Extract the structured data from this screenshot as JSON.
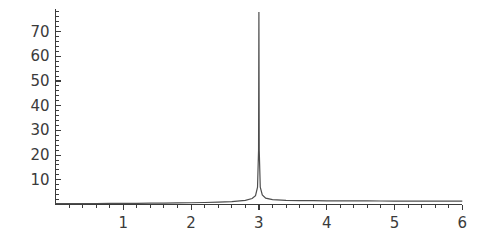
{
  "chart_data": {
    "type": "line",
    "title": "",
    "subtitle": "",
    "xlabel": "",
    "ylabel": "",
    "xlim": [
      0,
      6
    ],
    "ylim": [
      0,
      78
    ],
    "grid": false,
    "legend": null,
    "background_color": "#ffffff",
    "line_color": "#4d4d4d",
    "axis_color": "#3b3b3b",
    "x_ticks": [
      {
        "value": 1,
        "label": "1"
      },
      {
        "value": 2,
        "label": "2"
      },
      {
        "value": 3,
        "label": "3"
      },
      {
        "value": 4,
        "label": "4"
      },
      {
        "value": 5,
        "label": "5"
      },
      {
        "value": 6,
        "label": "6"
      }
    ],
    "y_ticks": [
      {
        "value": 10,
        "label": "10"
      },
      {
        "value": 20,
        "label": "20"
      },
      {
        "value": 30,
        "label": "30"
      },
      {
        "value": 40,
        "label": "40"
      },
      {
        "value": 50,
        "label": "50"
      },
      {
        "value": 60,
        "label": "60"
      },
      {
        "value": 70,
        "label": "70"
      }
    ],
    "x_minor_ticks_per_interval": 4,
    "y_minor_ticks_per_interval": 4,
    "annotations": [
      {
        "text": "singular spike at x = 3",
        "x": 3,
        "y": 78
      }
    ],
    "series": [
      {
        "name": "f(x)",
        "x": [
          0.0,
          0.2,
          0.4,
          0.6,
          0.8,
          1.0,
          1.2,
          1.4,
          1.6,
          1.8,
          2.0,
          2.2,
          2.4,
          2.6,
          2.8,
          2.9,
          2.95,
          2.98,
          2.995,
          3.0,
          3.005,
          3.02,
          3.05,
          3.1,
          3.2,
          3.4,
          3.6,
          3.8,
          4.0,
          4.2,
          4.4,
          4.6,
          4.8,
          5.0,
          5.2,
          5.4,
          5.6,
          5.8,
          6.0
        ],
        "y": [
          0.35,
          0.36,
          0.38,
          0.4,
          0.42,
          0.45,
          0.48,
          0.52,
          0.57,
          0.63,
          0.7,
          0.8,
          0.95,
          1.2,
          1.7,
          2.4,
          3.6,
          7.0,
          22.0,
          78.0,
          22.0,
          7.0,
          3.9,
          2.6,
          2.0,
          1.7,
          1.6,
          1.55,
          1.5,
          1.48,
          1.46,
          1.44,
          1.42,
          1.4,
          1.39,
          1.38,
          1.37,
          1.36,
          1.35
        ]
      }
    ]
  }
}
